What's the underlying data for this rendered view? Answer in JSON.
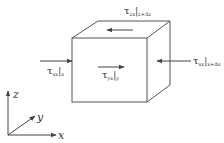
{
  "diagram": {
    "line_color": "#555555",
    "labels": {
      "top": {
        "symbol": "τ",
        "sub": "zx",
        "eval": "z+Δz"
      },
      "left": {
        "symbol": "τ",
        "sub": "xx",
        "eval": "x"
      },
      "center": {
        "symbol": "τ",
        "sub": "yx",
        "eval": "y"
      },
      "right": {
        "symbol": "τ",
        "sub": "xx",
        "eval": "x+Δx"
      }
    },
    "axes": {
      "z": "z",
      "y": "y",
      "x": "x"
    }
  }
}
